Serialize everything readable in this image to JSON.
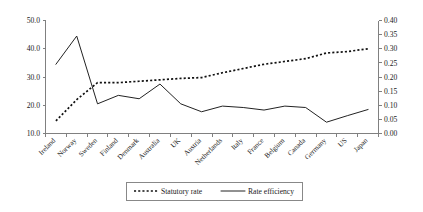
{
  "chart_data": {
    "type": "line",
    "title": "",
    "xlabel": "",
    "ylabel": "",
    "y2label": "",
    "grid": false,
    "legend_position": "bottom",
    "categories": [
      "Ireland",
      "Norway",
      "Sweden",
      "Finland",
      "Denmark",
      "Australia",
      "UK",
      "Austria",
      "Netherlands",
      "Italy",
      "France",
      "Belgium",
      "Canada",
      "Germany",
      "US",
      "Japan"
    ],
    "axes": {
      "left": {
        "label": "",
        "ylim": [
          10.0,
          50.0
        ],
        "ticks": [
          "10.0",
          "20.0",
          "30.0",
          "40.0",
          "50.0"
        ],
        "tick_values": [
          10.0,
          20.0,
          30.0,
          40.0,
          50.0
        ]
      },
      "right": {
        "label": "",
        "ylim": [
          0.0,
          0.4
        ],
        "ticks": [
          "0.00",
          "0.05",
          "0.10",
          "0.15",
          "0.20",
          "0.25",
          "0.30",
          "0.35",
          "0.40"
        ],
        "tick_values": [
          0.0,
          0.05,
          0.1,
          0.15,
          0.2,
          0.25,
          0.3,
          0.35,
          0.4
        ]
      }
    },
    "series": [
      {
        "name": "Statutory rate",
        "axis": "left",
        "style": "dotted",
        "values": [
          14.5,
          22.0,
          28.0,
          28.0,
          28.5,
          29.0,
          29.5,
          29.8,
          31.5,
          33.0,
          34.5,
          35.5,
          36.5,
          38.5,
          39.0,
          40.0
        ]
      },
      {
        "name": "Rate efficiency",
        "axis": "right",
        "style": "solid",
        "values": [
          0.245,
          0.345,
          0.105,
          0.135,
          0.123,
          0.175,
          0.105,
          0.077,
          0.097,
          0.092,
          0.083,
          0.097,
          0.092,
          0.04,
          0.063,
          0.085
        ]
      }
    ],
    "legend": [
      {
        "label": "Statutory rate",
        "style": "dotted"
      },
      {
        "label": "Rate efficiency",
        "style": "solid"
      }
    ]
  },
  "colors": {
    "background": "#ffffff",
    "axis": "#808080",
    "series_statutory": "#111111",
    "series_efficiency": "#222222",
    "text": "#1a1a1a"
  }
}
